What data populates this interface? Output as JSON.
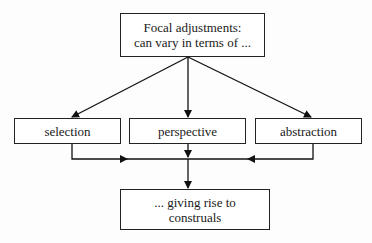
{
  "diagram": {
    "top": {
      "line1": "Focal adjustments:",
      "line2": "can vary in terms of ..."
    },
    "middle": [
      {
        "label": "selection"
      },
      {
        "label": "perspective"
      },
      {
        "label": "abstraction"
      }
    ],
    "bottom": {
      "line1": "... giving rise to",
      "line2": "construals"
    }
  }
}
